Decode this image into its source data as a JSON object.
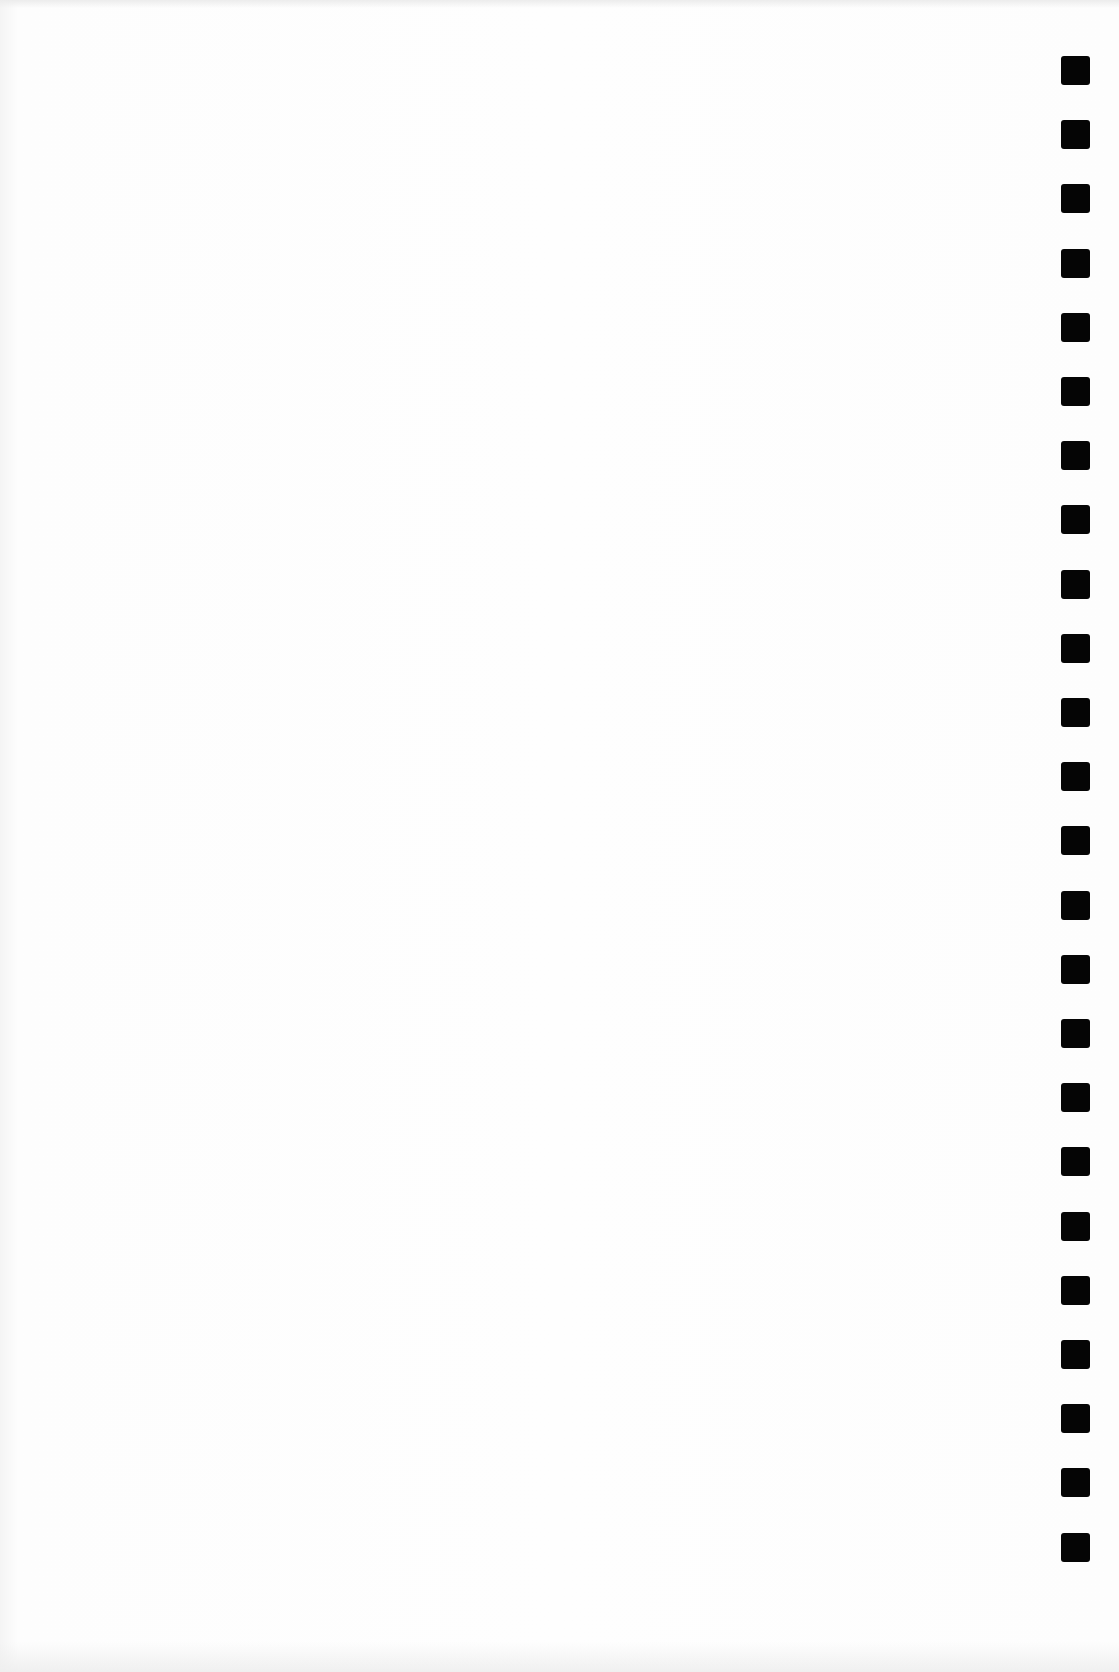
{
  "page": {
    "type": "blank-scanned-page",
    "background_color": "#fdfdfd",
    "text": ""
  },
  "edge_marks": {
    "color": "#050505",
    "count": 24,
    "x": 1061,
    "first_y": 56,
    "pitch": 64.2,
    "size": 29
  }
}
